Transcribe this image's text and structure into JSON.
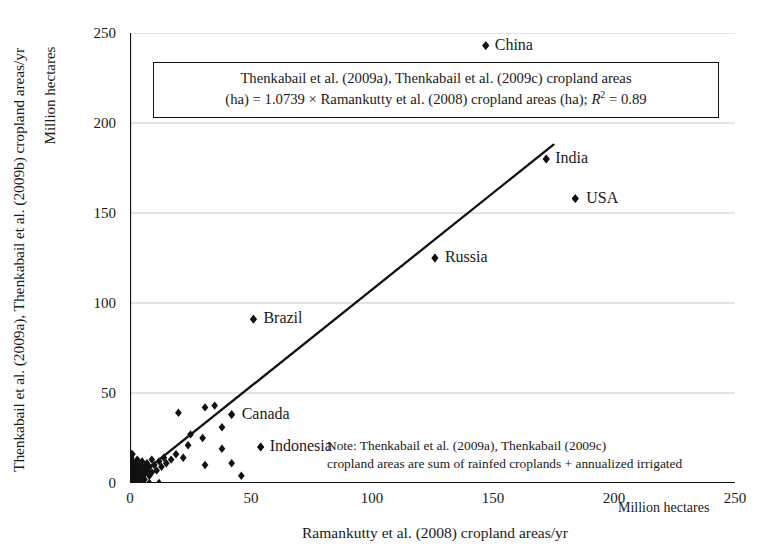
{
  "chart_data": {
    "type": "scatter",
    "title": "",
    "xlabel": "Ramankutty et al. (2008) cropland areas/yr",
    "ylabel": "Thenkabail et al. (2009a), Thenkabail et al. (2009b) cropland areas/yr",
    "x_units": "Million hectares",
    "y_units": "Million hectares",
    "xlim": [
      0,
      250
    ],
    "ylim": [
      0,
      250
    ],
    "xticks": [
      "0",
      "50",
      "100",
      "150",
      "200",
      "250"
    ],
    "yticks": [
      "0",
      "50",
      "100",
      "150",
      "200",
      "250"
    ],
    "grid": "horizontal",
    "legend": "none",
    "marker": "diamond",
    "marker_color": "#111111",
    "line_color": "#111111",
    "equation_text_line1": "Thenkabail et al. (2009a), Thenkabail et al. (2009c) cropland areas",
    "equation_text_line2_a": "(ha) = 1.0739 × Ramankutty et al. (2008) cropland areas (ha); ",
    "equation_text_line2_r": "R",
    "equation_text_line2_sup": "2",
    "equation_text_line2_b": " = 0.89",
    "slope": 1.0739,
    "intercept": 0,
    "r_squared": 0.89,
    "trendline": {
      "x0": 0,
      "y0": 0,
      "x1": 175,
      "y1": 188
    },
    "note_line1": "Note: Thenkabail et al. (2009a), Thenkabail (2009c)",
    "note_line2": "cropland areas are sum of rainfed croplands + annualized irrigated",
    "labeled_points": [
      {
        "label": "China",
        "x": 147,
        "y": 243,
        "label_dx": 9,
        "label_dy": -10
      },
      {
        "label": "India",
        "x": 172,
        "y": 180,
        "label_dx": 9,
        "label_dy": -10
      },
      {
        "label": "USA",
        "x": 184,
        "y": 158,
        "label_dx": 11,
        "label_dy": -10
      },
      {
        "label": "Russia",
        "x": 126,
        "y": 125,
        "label_dx": 10,
        "label_dy": -10
      },
      {
        "label": "Brazil",
        "x": 51,
        "y": 91,
        "label_dx": 10,
        "label_dy": -10
      },
      {
        "label": "Canada",
        "x": 42,
        "y": 38,
        "label_dx": 10,
        "label_dy": -10
      },
      {
        "label": "Indonesia",
        "x": 54,
        "y": 20,
        "label_dx": 9,
        "label_dy": -10
      }
    ],
    "points": [
      {
        "x": 147,
        "y": 243
      },
      {
        "x": 172,
        "y": 180
      },
      {
        "x": 184,
        "y": 158
      },
      {
        "x": 126,
        "y": 125
      },
      {
        "x": 51,
        "y": 91
      },
      {
        "x": 42,
        "y": 38
      },
      {
        "x": 54,
        "y": 20
      },
      {
        "x": 20,
        "y": 39
      },
      {
        "x": 31,
        "y": 42
      },
      {
        "x": 35,
        "y": 43
      },
      {
        "x": 38,
        "y": 31
      },
      {
        "x": 30,
        "y": 25
      },
      {
        "x": 24,
        "y": 21
      },
      {
        "x": 25,
        "y": 27
      },
      {
        "x": 38,
        "y": 19
      },
      {
        "x": 31,
        "y": 10
      },
      {
        "x": 42,
        "y": 11
      },
      {
        "x": 46,
        "y": 4
      },
      {
        "x": 22,
        "y": 14
      },
      {
        "x": 19,
        "y": 16
      },
      {
        "x": 17,
        "y": 13
      },
      {
        "x": 15,
        "y": 11
      },
      {
        "x": 14,
        "y": 14
      },
      {
        "x": 13,
        "y": 9
      },
      {
        "x": 12,
        "y": 12
      },
      {
        "x": 11,
        "y": 7
      },
      {
        "x": 10,
        "y": 10
      },
      {
        "x": 9,
        "y": 13
      },
      {
        "x": 9,
        "y": 6
      },
      {
        "x": 8,
        "y": 9
      },
      {
        "x": 8,
        "y": 4
      },
      {
        "x": 7,
        "y": 11
      },
      {
        "x": 7,
        "y": 7
      },
      {
        "x": 6,
        "y": 9
      },
      {
        "x": 6,
        "y": 5
      },
      {
        "x": 6,
        "y": 2
      },
      {
        "x": 5,
        "y": 12
      },
      {
        "x": 5,
        "y": 8
      },
      {
        "x": 5,
        "y": 5
      },
      {
        "x": 5,
        "y": 2
      },
      {
        "x": 4,
        "y": 10
      },
      {
        "x": 4,
        "y": 7
      },
      {
        "x": 4,
        "y": 4
      },
      {
        "x": 4,
        "y": 1
      },
      {
        "x": 3,
        "y": 13
      },
      {
        "x": 3,
        "y": 9
      },
      {
        "x": 3,
        "y": 6
      },
      {
        "x": 3,
        "y": 3
      },
      {
        "x": 3,
        "y": 1
      },
      {
        "x": 2,
        "y": 11
      },
      {
        "x": 2,
        "y": 8
      },
      {
        "x": 2,
        "y": 5
      },
      {
        "x": 2,
        "y": 3
      },
      {
        "x": 2,
        "y": 1
      },
      {
        "x": 1,
        "y": 16
      },
      {
        "x": 1,
        "y": 12
      },
      {
        "x": 1,
        "y": 9
      },
      {
        "x": 1,
        "y": 6
      },
      {
        "x": 1,
        "y": 4
      },
      {
        "x": 1,
        "y": 2
      },
      {
        "x": 1,
        "y": 1
      },
      {
        "x": 0.5,
        "y": 14
      },
      {
        "x": 0.5,
        "y": 10
      },
      {
        "x": 0.5,
        "y": 7
      },
      {
        "x": 0.5,
        "y": 5
      },
      {
        "x": 0.5,
        "y": 3
      },
      {
        "x": 0.5,
        "y": 1
      },
      {
        "x": 0,
        "y": 17
      },
      {
        "x": 0,
        "y": 13
      },
      {
        "x": 0,
        "y": 8
      },
      {
        "x": 0,
        "y": 5
      },
      {
        "x": 0,
        "y": 2
      },
      {
        "x": 0,
        "y": 0
      },
      {
        "x": 12,
        "y": 0
      },
      {
        "x": 8,
        "y": 0
      },
      {
        "x": 5,
        "y": 0
      },
      {
        "x": 3,
        "y": 0
      }
    ]
  }
}
